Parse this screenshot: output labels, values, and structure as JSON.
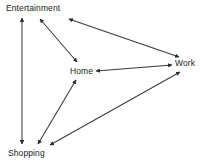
{
  "diagram": {
    "type": "directed-graph",
    "background_color": "#ffffff",
    "stroke_color": "#333333",
    "text_color": "#1a1a1a",
    "nodes": [
      {
        "id": "entertainment",
        "label": "Entertainment",
        "x": 40,
        "y": 8
      },
      {
        "id": "home",
        "label": "Home",
        "x": 82,
        "y": 71
      },
      {
        "id": "work",
        "label": "Work",
        "x": 186,
        "y": 63
      },
      {
        "id": "shopping",
        "label": "Shopping",
        "x": 30,
        "y": 153
      }
    ],
    "edges": [
      {
        "id": "entertainment-shopping",
        "from": "entertainment",
        "to": "shopping",
        "bidirectional": true,
        "x1": 22,
        "y1": 18,
        "x2": 22,
        "y2": 144
      },
      {
        "id": "entertainment-home",
        "from": "entertainment",
        "to": "home",
        "bidirectional": true,
        "x1": 40,
        "y1": 19,
        "x2": 77,
        "y2": 62
      },
      {
        "id": "entertainment-work",
        "from": "entertainment",
        "to": "work",
        "bidirectional": true,
        "x1": 69,
        "y1": 19,
        "x2": 179,
        "y2": 57
      },
      {
        "id": "home-work",
        "from": "home",
        "to": "work",
        "bidirectional": true,
        "x1": 96,
        "y1": 71,
        "x2": 172,
        "y2": 65
      },
      {
        "id": "home-shopping",
        "from": "home",
        "to": "shopping",
        "bidirectional": true,
        "x1": 76,
        "y1": 80,
        "x2": 38,
        "y2": 144
      },
      {
        "id": "shopping-work",
        "from": "shopping",
        "to": "work",
        "bidirectional": true,
        "x1": 50,
        "y1": 145,
        "x2": 180,
        "y2": 72
      }
    ]
  }
}
